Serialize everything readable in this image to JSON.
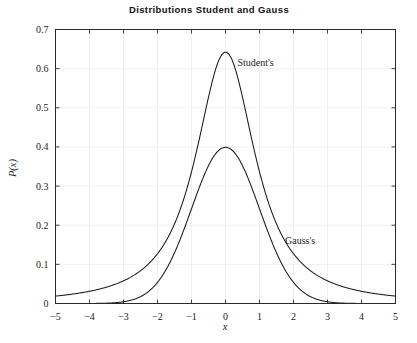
{
  "chart_data": {
    "type": "line",
    "title": "Distributions Student and Gauss",
    "xlabel": "x",
    "ylabel": "P(x)",
    "xlim": [
      -5,
      5
    ],
    "ylim": [
      0,
      0.7
    ],
    "xticks": [
      -5,
      -4,
      -3,
      -2,
      -1,
      0,
      1,
      2,
      3,
      4,
      5
    ],
    "xticklabels": [
      "−5",
      "−4",
      "−3",
      "−2",
      "−1",
      "0",
      "1",
      "2",
      "3",
      "4",
      "5"
    ],
    "yticks": [
      0,
      0.1,
      0.2,
      0.3,
      0.4,
      0.5,
      0.6,
      0.7
    ],
    "yticklabels": [
      "0",
      "0.1",
      "0.2",
      "0.3",
      "0.4",
      "0.5",
      "0.6",
      "0.7"
    ],
    "grid": true,
    "legend": "inline-annotations",
    "series": [
      {
        "name": "Student's",
        "kind": "student-t",
        "nu": 1.4,
        "peak": 0.642,
        "annotation": {
          "text": "Student's",
          "x": 0.35,
          "y": 0.607
        },
        "x": [
          -5,
          -4.75,
          -4.5,
          -4.25,
          -4,
          -3.75,
          -3.5,
          -3.25,
          -3,
          -2.75,
          -2.5,
          -2.25,
          -2,
          -1.75,
          -1.5,
          -1.25,
          -1,
          -0.75,
          -0.5,
          -0.25,
          0,
          0.25,
          0.5,
          0.75,
          1,
          1.25,
          1.5,
          1.75,
          2,
          2.25,
          2.5,
          2.75,
          3,
          3.25,
          3.5,
          3.75,
          4,
          4.25,
          4.5,
          4.75,
          5
        ],
        "y": [
          0.0049,
          0.0057,
          0.0067,
          0.008,
          0.0096,
          0.0117,
          0.0144,
          0.0179,
          0.0226,
          0.029,
          0.0379,
          0.0505,
          0.0686,
          0.0951,
          0.1339,
          0.1901,
          0.2678,
          0.3664,
          0.4755,
          0.5718,
          0.642,
          0.5718,
          0.4755,
          0.3664,
          0.2678,
          0.1901,
          0.1339,
          0.0951,
          0.0686,
          0.0505,
          0.0379,
          0.029,
          0.0226,
          0.0179,
          0.0144,
          0.0117,
          0.0096,
          0.008,
          0.0067,
          0.0057,
          0.0049
        ]
      },
      {
        "name": "Gauss's",
        "kind": "gaussian",
        "mu": 0,
        "sigma": 1,
        "peak": 0.3989,
        "annotation": {
          "text": "Gauss's",
          "x": 1.75,
          "y": 0.152
        },
        "x": [
          -5,
          -4.75,
          -4.5,
          -4.25,
          -4,
          -3.75,
          -3.5,
          -3.25,
          -3,
          -2.75,
          -2.5,
          -2.25,
          -2,
          -1.75,
          -1.5,
          -1.25,
          -1,
          -0.75,
          -0.5,
          -0.25,
          0,
          0.25,
          0.5,
          0.75,
          1,
          1.25,
          1.5,
          1.75,
          2,
          2.25,
          2.5,
          2.75,
          3,
          3.25,
          3.5,
          3.75,
          4,
          4.25,
          4.5,
          4.75,
          5
        ],
        "y": [
          1.5e-06,
          4.9e-06,
          1.6e-05,
          4.57e-05,
          0.0001338,
          0.0003561,
          0.0008727,
          0.0020357,
          0.0044318,
          0.0090933,
          0.0175283,
          0.031658,
          0.053991,
          0.0862773,
          0.1295176,
          0.1826491,
          0.2419707,
          0.3011374,
          0.3520653,
          0.3866681,
          0.3989423,
          0.3866681,
          0.3520653,
          0.3011374,
          0.2419707,
          0.1826491,
          0.1295176,
          0.0862773,
          0.053991,
          0.031658,
          0.0175283,
          0.0090933,
          0.0044318,
          0.0020357,
          0.0008727,
          0.0003561,
          0.0001338,
          4.57e-05,
          1.6e-05,
          4.9e-06,
          1.5e-06
        ]
      }
    ],
    "colors": {
      "curve": "#1a1a1a",
      "frame": "#2a2a2a",
      "grid": "#e9e9e9"
    }
  }
}
